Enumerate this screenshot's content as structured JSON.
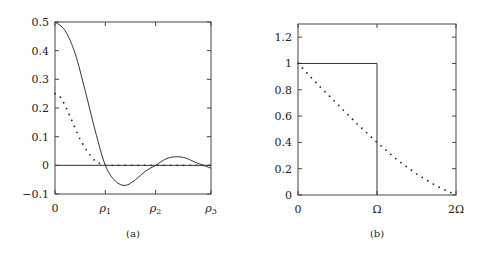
{
  "chart_data": [
    {
      "type": "line",
      "panel_label": "(a)",
      "title": "",
      "xlabel": "",
      "ylabel": "",
      "xlim": [
        0,
        3.1
      ],
      "ylim": [
        -0.1,
        0.5
      ],
      "x_ticks": [
        {
          "pos": 0,
          "label": "0"
        },
        {
          "pos": 1,
          "label": "ρ1"
        },
        {
          "pos": 2,
          "label": "ρ2"
        },
        {
          "pos": 3.1,
          "label": "ρ3"
        }
      ],
      "y_ticks": [
        "-0.1",
        "0",
        "0.1",
        "0.2",
        "0.3",
        "0.4",
        "0.5"
      ],
      "grid": false,
      "legend": "none",
      "series": [
        {
          "name": "solid",
          "style": "solid",
          "x": [
            0,
            0.2,
            0.4,
            0.6,
            0.8,
            1.0,
            1.2,
            1.4,
            1.6,
            1.8,
            2.0,
            2.2,
            2.4,
            2.6,
            2.8,
            3.1
          ],
          "y": [
            0.5,
            0.47,
            0.39,
            0.26,
            0.12,
            0.0,
            -0.055,
            -0.07,
            -0.05,
            -0.02,
            0.0,
            0.022,
            0.03,
            0.025,
            0.01,
            -0.01
          ]
        },
        {
          "name": "dotted",
          "style": "dotted",
          "x": [
            0,
            0.1,
            0.2,
            0.3,
            0.4,
            0.5,
            0.6,
            0.7,
            0.8,
            0.9,
            1.0,
            1.5,
            2.0,
            2.5,
            3.1
          ],
          "y": [
            0.25,
            0.24,
            0.21,
            0.17,
            0.13,
            0.09,
            0.06,
            0.035,
            0.015,
            0.005,
            0.0,
            0.0,
            0.0,
            0.0,
            0.0
          ]
        },
        {
          "name": "zero-line",
          "style": "solid",
          "x": [
            0,
            3.1
          ],
          "y": [
            0,
            0
          ]
        }
      ]
    },
    {
      "type": "line",
      "panel_label": "(b)",
      "title": "",
      "xlabel": "",
      "ylabel": "",
      "xlim": [
        0,
        2
      ],
      "ylim": [
        0,
        1.3
      ],
      "x_ticks": [
        {
          "pos": 0,
          "label": "0"
        },
        {
          "pos": 1,
          "label": "Ω"
        },
        {
          "pos": 2,
          "label": "2Ω"
        }
      ],
      "y_ticks": [
        "0",
        "0.2",
        "0.4",
        "0.6",
        "0.8",
        "1",
        "1.2"
      ],
      "grid": false,
      "legend": "none",
      "series": [
        {
          "name": "rectangle",
          "style": "solid",
          "x": [
            0,
            1,
            1
          ],
          "y": [
            1,
            1,
            0
          ]
        },
        {
          "name": "dotted",
          "style": "dotted",
          "x": [
            0,
            0.25,
            0.5,
            0.75,
            1.0,
            1.25,
            1.5,
            1.75,
            2.0
          ],
          "y": [
            1.0,
            0.84,
            0.69,
            0.54,
            0.4,
            0.27,
            0.16,
            0.07,
            0.0
          ]
        }
      ]
    }
  ]
}
